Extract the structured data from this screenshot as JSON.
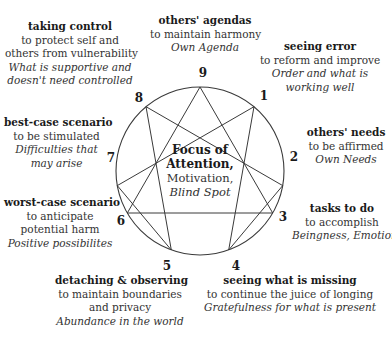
{
  "diagram": {
    "type": "enneagram",
    "center": {
      "title_line1": "Focus of",
      "title_line2": "Attention,",
      "motivation": "Motivation,",
      "blind_spot": "Blind Spot"
    },
    "points": [
      {
        "number": "1",
        "focus": "seeing error",
        "motivation": [
          "to reform and improve"
        ],
        "blind_spot": [
          "Order and what is",
          "working well"
        ]
      },
      {
        "number": "2",
        "focus": "others' needs",
        "motivation": [
          "to be affirmed"
        ],
        "blind_spot": [
          "Own Needs"
        ]
      },
      {
        "number": "3",
        "focus": "tasks to do",
        "motivation": [
          "to accomplish"
        ],
        "blind_spot": [
          "Beingness, Emotions"
        ]
      },
      {
        "number": "4",
        "focus": "seeing what is missing",
        "motivation": [
          "to continue the juice of longing"
        ],
        "blind_spot": [
          "Gratefulness for what is present"
        ]
      },
      {
        "number": "5",
        "focus": "detaching & observing",
        "motivation": [
          "to maintain boundaries",
          "and privacy"
        ],
        "blind_spot": [
          "Abundance in the world"
        ]
      },
      {
        "number": "6",
        "focus": "worst-case scenario",
        "motivation": [
          "to anticipate",
          "potential harm"
        ],
        "blind_spot": [
          "Positive possibilites"
        ]
      },
      {
        "number": "7",
        "focus": "best-case scenario",
        "motivation": [
          "to be stimulated"
        ],
        "blind_spot": [
          "Difficulties that",
          "may arise"
        ]
      },
      {
        "number": "8",
        "focus": "taking control",
        "motivation": [
          "to protect self and",
          "others from vulnerability"
        ],
        "blind_spot": [
          "What is supportive and",
          "doesn't need controlled"
        ]
      },
      {
        "number": "9",
        "focus": "others' agendas",
        "motivation": [
          "to maintain harmony"
        ],
        "blind_spot": [
          "Own Agenda"
        ]
      }
    ],
    "lines": {
      "triangle": [
        "3",
        "6",
        "9"
      ],
      "hexad": [
        "1",
        "4",
        "2",
        "8",
        "5",
        "7",
        "1"
      ]
    },
    "colors": {
      "line": "#3a3a3a",
      "text": "#2a2a2a",
      "background": "#ffffff"
    }
  }
}
